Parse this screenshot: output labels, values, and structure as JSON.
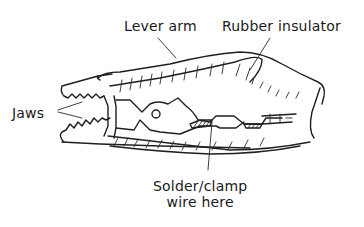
{
  "diagram": {
    "labels": {
      "lever_arm": "Lever arm",
      "rubber_insulator": "Rubber insulator",
      "jaws": "Jaws",
      "solder_line1": "Solder/clamp",
      "solder_line2": "wire here"
    },
    "colors": {
      "ink": "#1f1f1f",
      "background": "#ffffff"
    }
  }
}
